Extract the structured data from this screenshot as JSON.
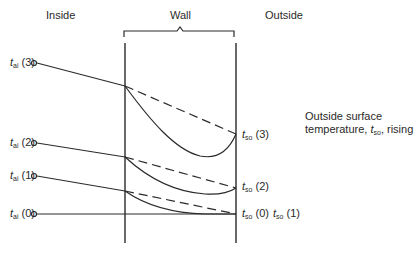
{
  "regions": {
    "inside": "Inside",
    "wall": "Wall",
    "outside": "Outside"
  },
  "inside_labels": [
    {
      "sym": "t",
      "sub": "ai",
      "idx": "(3)"
    },
    {
      "sym": "t",
      "sub": "ai",
      "idx": "(2)"
    },
    {
      "sym": "t",
      "sub": "ai",
      "idx": "(1)"
    },
    {
      "sym": "t",
      "sub": "ai",
      "idx": "(0)"
    }
  ],
  "outside_labels": [
    {
      "sym": "t",
      "sub": "so",
      "idx": "(3)"
    },
    {
      "sym": "t",
      "sub": "so",
      "idx": "(2)"
    },
    {
      "sym": "t",
      "sub": "so",
      "idx": "(0)"
    },
    {
      "sym": "t",
      "sub": "so",
      "idx": "(1)"
    }
  ],
  "annotation": {
    "line1": "Outside surface",
    "line2_pre": "temperature, ",
    "sym": "t",
    "sub": "so",
    "line2_post": ", rising"
  },
  "colors": {
    "ink": "#2a2a2a",
    "background": "#ffffff"
  }
}
